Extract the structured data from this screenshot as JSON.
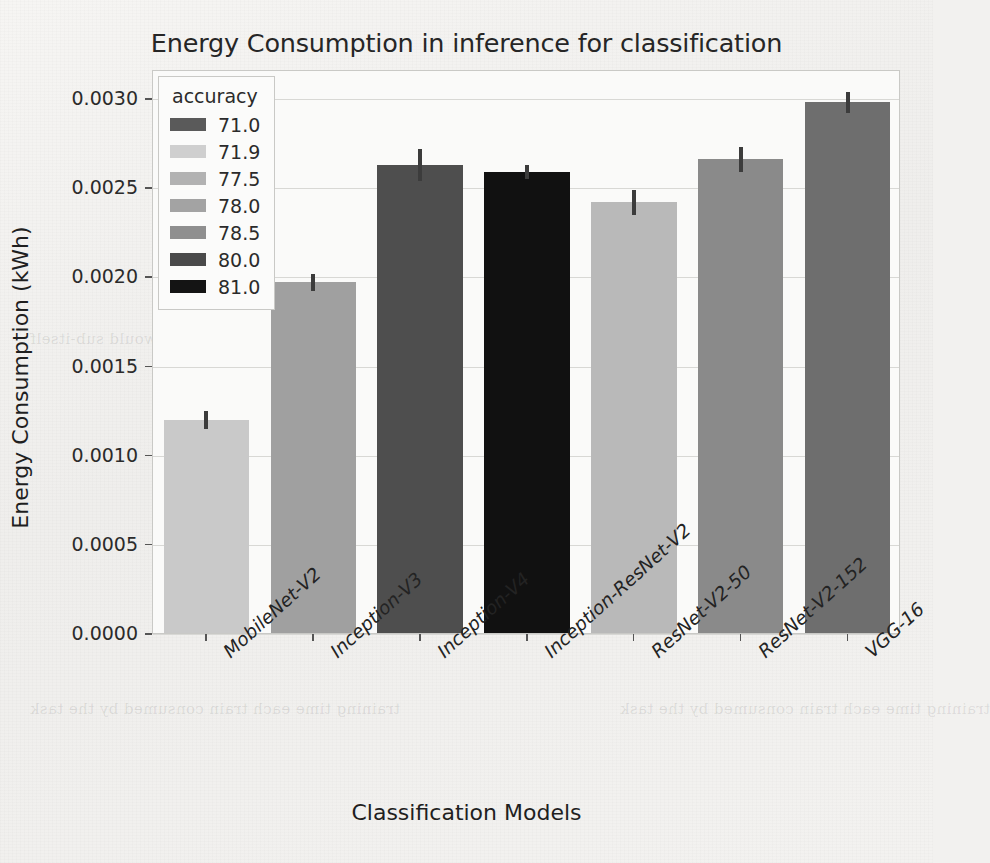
{
  "chart_data": {
    "type": "bar",
    "title": "Energy Consumption in inference for classification",
    "xlabel": "Classification Models",
    "ylabel": "Energy Consumption (kWh)",
    "categories": [
      "MobileNet-V2",
      "Inception-V3",
      "Inception-V4",
      "Inception-ResNet-V2",
      "ResNet-V2-50",
      "ResNet-V2-152",
      "VGG-16"
    ],
    "values": [
      0.00119,
      0.00196,
      0.00262,
      0.00258,
      0.00241,
      0.00265,
      0.00297
    ],
    "errors": [
      5e-05,
      5e-05,
      9e-05,
      4e-05,
      7e-05,
      7e-05,
      6e-05
    ],
    "bar_colors": [
      "#c9c9c9",
      "#a0a0a0",
      "#4e4e4e",
      "#111111",
      "#b9b9b9",
      "#8a8a8a",
      "#6e6e6e"
    ],
    "ylim": [
      0.0,
      0.003
    ],
    "yticks": [
      "0.0000",
      "0.0005",
      "0.0010",
      "0.0015",
      "0.0020",
      "0.0025",
      "0.0030"
    ],
    "ytick_values": [
      0.0,
      0.0005,
      0.001,
      0.0015,
      0.002,
      0.0025,
      0.003
    ],
    "grid": true,
    "legend_position": "upper left",
    "legend": {
      "title": "accuracy",
      "entries": [
        {
          "label": "71.0",
          "color": "#5a5a5a"
        },
        {
          "label": "71.9",
          "color": "#cfcfcf"
        },
        {
          "label": "77.5",
          "color": "#b2b2b2"
        },
        {
          "label": "78.0",
          "color": "#a3a3a3"
        },
        {
          "label": "78.5",
          "color": "#8f8f8f"
        },
        {
          "label": "80.0",
          "color": "#4a4a4a"
        },
        {
          "label": "81.0",
          "color": "#141414"
        }
      ]
    }
  },
  "ghost": {
    "lines": [
      "consumption as well as the same effect for",
      "name and the static variable would sub-itself",
      "training time each train consumed by the task"
    ]
  }
}
